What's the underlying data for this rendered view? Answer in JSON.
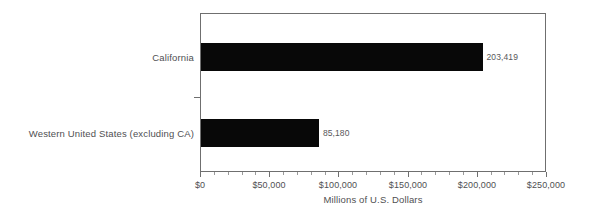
{
  "chart_data": {
    "type": "bar",
    "orientation": "horizontal",
    "title": "",
    "xlabel": "Millions of U.S. Dollars",
    "ylabel": "",
    "xlim": [
      0,
      250000
    ],
    "grid": false,
    "legend": null,
    "bar_color": "#080808",
    "axis_color": "#6f6f6f",
    "text_color": "#4f4f52",
    "categories": [
      "California",
      "Western United States (excluding CA)"
    ],
    "values": [
      203419,
      85180
    ],
    "data_labels": [
      "203,419",
      "85,180"
    ],
    "x_ticks": [
      0,
      50000,
      100000,
      150000,
      200000,
      250000
    ],
    "x_tick_labels": [
      "$0",
      "$50,000",
      "$100,000",
      "$150,000",
      "$200,000",
      "$250,000"
    ],
    "x_minor_ticks_per_interval": 5
  }
}
